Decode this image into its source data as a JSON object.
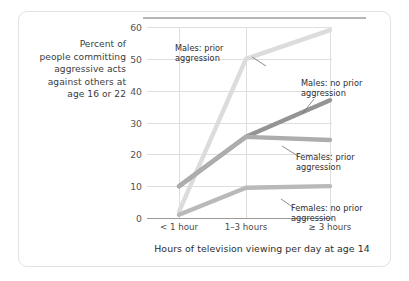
{
  "chart_data": {
    "type": "line",
    "title": "",
    "xlabel": "Hours of television viewing per day at age 14",
    "ylabel": "Percent of people committing aggressive acts against others at age 16 or 22",
    "categories": [
      "< 1 hour",
      "1–3 hours",
      "≥ 3 hours"
    ],
    "ylim": [
      0,
      60
    ],
    "yticks": [
      0,
      10,
      20,
      30,
      40,
      50,
      60
    ],
    "grid": true,
    "legend_position": "inline-annotations",
    "series": [
      {
        "name": "Males: prior aggression",
        "values": [
          2,
          50,
          59
        ],
        "color": "#dcdcdc"
      },
      {
        "name": "Males: no prior aggression",
        "values": [
          10,
          25.5,
          37
        ],
        "color": "#949494"
      },
      {
        "name": "Females: prior aggression",
        "values": [
          10,
          25.5,
          24.5
        ],
        "color": "#adadad"
      },
      {
        "name": "Females: no prior aggression",
        "values": [
          1,
          9.5,
          10
        ],
        "color": "#b9b9b9"
      }
    ]
  },
  "axis": {
    "ytick_labels": [
      "0",
      "10",
      "20",
      "30",
      "40",
      "50",
      "60"
    ],
    "xtick_labels": [
      "< 1 hour",
      "1–3 hours",
      "≥ 3 hours"
    ],
    "y_caption_lines": [
      "Percent of",
      "people committing",
      "aggressive acts",
      "against others at",
      "age 16 or 22"
    ],
    "x_caption": "Hours of television viewing per day at age 14"
  },
  "annotations": [
    {
      "id": "males-prior",
      "lines": [
        "Males: prior",
        "aggression"
      ]
    },
    {
      "id": "males-noprior",
      "lines": [
        "Males: no prior",
        "aggression"
      ]
    },
    {
      "id": "females-prior",
      "lines": [
        "Females: prior",
        "aggression"
      ]
    },
    {
      "id": "females-noprior",
      "lines": [
        "Females: no prior",
        "aggression"
      ]
    }
  ],
  "colors": {
    "background": "#ffffff",
    "card_border": "#e2e2e2",
    "gridline": "#dedede",
    "axis_line": "#9a9a9a",
    "text": "#2d2d2d",
    "tick_text": "#555555"
  }
}
